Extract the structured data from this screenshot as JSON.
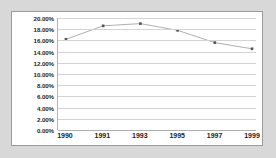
{
  "chart_data": {
    "type": "line",
    "title": "",
    "subtitle": "",
    "xlabel": "",
    "ylabel": "",
    "categories": [
      "1990",
      "1991",
      "1993",
      "1995",
      "1997",
      "1999"
    ],
    "values": [
      16.2,
      18.6,
      19.0,
      17.8,
      15.6,
      14.5
    ],
    "series": [
      {
        "name": "",
        "values": [
          16.2,
          18.6,
          19.0,
          17.8,
          15.6,
          14.5
        ]
      }
    ],
    "ylim": [
      0,
      20
    ],
    "ytick_step": 2,
    "ytick_labels": [
      "20.00%",
      "18.00%",
      "16.00%",
      "14.00%",
      "12.00%",
      "10.00%",
      "8.00%",
      "6.00%",
      "4.00%",
      "2.00%",
      "0.00%"
    ],
    "ytick_values": [
      20,
      18,
      16,
      14,
      12,
      10,
      8,
      6,
      4,
      2,
      0
    ],
    "grid": true,
    "grid_axis": "y",
    "legend": false,
    "legend_position": "none",
    "annotations": [],
    "colors": {
      "line": "#b0b0b0",
      "marker": "#555555",
      "gridline": "#d3d3d3",
      "axis": "#b0b0b0",
      "text": "#1d1d1d",
      "plot_background": "#ffffff",
      "page_background": "#d8d8d8",
      "card_border": "#9a9a9a"
    }
  }
}
